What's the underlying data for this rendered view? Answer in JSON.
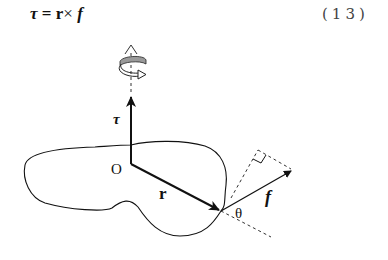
{
  "equation": {
    "lhs": "τ",
    "equals": "=",
    "r": "r",
    "times": "×",
    "f": "f",
    "number": "(13)"
  },
  "diagram": {
    "labels": {
      "torque": "τ",
      "origin": "O",
      "position": "r",
      "force": "f",
      "angle": "θ"
    },
    "colors": {
      "stroke": "#111111",
      "dashed": "#333333",
      "rotation_arrow_fill": "#9a9a9a"
    }
  }
}
